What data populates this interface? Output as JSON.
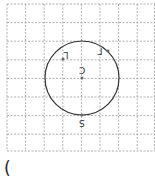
{
  "diagram": {
    "grid": {
      "x0": 7,
      "y0": 4,
      "cell": 18.6,
      "cols": 8,
      "rows": 8,
      "color": "#9a9a9a"
    },
    "circle": {
      "cx": 82,
      "cy": 78,
      "r": 37,
      "color": "#333333"
    },
    "points": [
      {
        "name": "center",
        "x": 82,
        "y": 78,
        "label": "C"
      },
      {
        "name": "left",
        "x": 63,
        "y": 59,
        "label": "L"
      },
      {
        "name": "right",
        "x": 108,
        "y": 51,
        "label": "Γ"
      },
      {
        "name": "bottom",
        "x": 82,
        "y": 115,
        "label": "S"
      }
    ]
  },
  "footer": {
    "paren": "("
  }
}
